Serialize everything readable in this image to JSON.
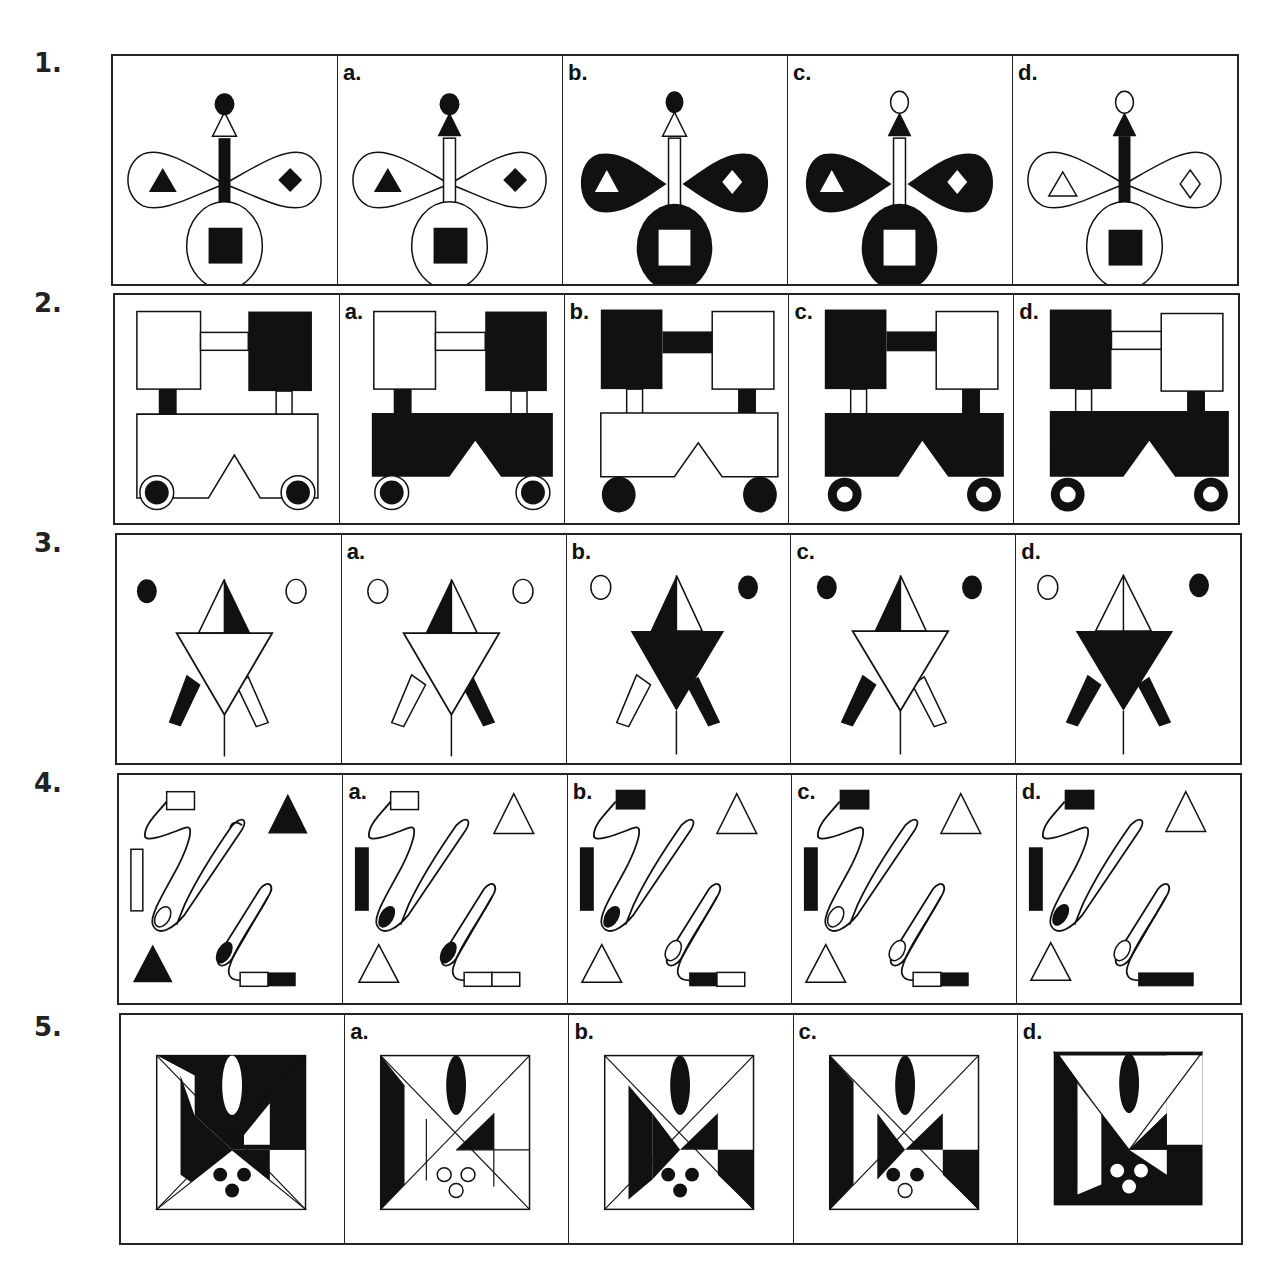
{
  "questions": [
    {
      "number": "1.",
      "options": [
        "",
        "a.",
        "b.",
        "c.",
        "d."
      ]
    },
    {
      "number": "2.",
      "options": [
        "",
        "a.",
        "b.",
        "c.",
        "d."
      ]
    },
    {
      "number": "3.",
      "options": [
        "",
        "a.",
        "b.",
        "c.",
        "d."
      ]
    },
    {
      "number": "4.",
      "options": [
        "",
        "a.",
        "b.",
        "c.",
        "d."
      ]
    },
    {
      "number": "5.",
      "options": [
        "",
        "a.",
        "b.",
        "c.",
        "d."
      ]
    }
  ],
  "colors": {
    "ink": "#111111",
    "paper": "#ffffff"
  }
}
